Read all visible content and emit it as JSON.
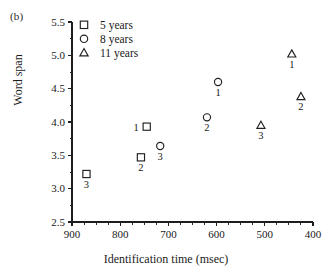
{
  "figure": {
    "panel_label": "(b)",
    "xlabel": "Identification time (msec)",
    "ylabel": "Word span"
  },
  "legend": {
    "position": "top-left-inside",
    "entries": [
      {
        "label": "5 years",
        "marker": "square-marker"
      },
      {
        "label": "8 years",
        "marker": "circle-marker"
      },
      {
        "label": "11 years",
        "marker": "triangle-marker"
      }
    ]
  },
  "axes": {
    "x_ticks": [
      "900",
      "800",
      "700",
      "600",
      "500",
      "400"
    ],
    "y_ticks": [
      "5.5",
      "5.0",
      "4.5",
      "4.0",
      "3.5",
      "3.0",
      "2.5"
    ]
  },
  "chart_data": {
    "type": "scatter",
    "title": "",
    "xlabel": "Identification time (msec)",
    "ylabel": "Word span",
    "xlim": [
      900,
      400
    ],
    "ylim": [
      2.5,
      5.5
    ],
    "x_reversed": true,
    "grid": false,
    "xticks": [
      900,
      800,
      700,
      600,
      500,
      400
    ],
    "yticks": [
      2.5,
      3.0,
      3.5,
      4.0,
      4.5,
      5.0,
      5.5
    ],
    "x_minor_tick_step": 25,
    "y_minor_tick_step": 0.25,
    "point_label_note": "Each point is annotated with its condition number 1, 2 or 3",
    "series": [
      {
        "name": "5 years",
        "marker": "square",
        "points": [
          {
            "label": "1",
            "x": 745,
            "y": 3.93,
            "label_side": "left"
          },
          {
            "label": "2",
            "x": 757,
            "y": 3.47,
            "label_side": "below"
          },
          {
            "label": "3",
            "x": 870,
            "y": 3.22,
            "label_side": "below"
          }
        ]
      },
      {
        "name": "8 years",
        "marker": "circle",
        "points": [
          {
            "label": "1",
            "x": 597,
            "y": 4.6,
            "label_side": "below"
          },
          {
            "label": "2",
            "x": 620,
            "y": 4.07,
            "label_side": "below"
          },
          {
            "label": "3",
            "x": 717,
            "y": 3.64,
            "label_side": "below"
          }
        ]
      },
      {
        "name": "11 years",
        "marker": "triangle",
        "points": [
          {
            "label": "1",
            "x": 444,
            "y": 5.02,
            "label_side": "below"
          },
          {
            "label": "2",
            "x": 425,
            "y": 4.38,
            "label_side": "below"
          },
          {
            "label": "3",
            "x": 508,
            "y": 3.95,
            "label_side": "below"
          }
        ]
      }
    ]
  }
}
